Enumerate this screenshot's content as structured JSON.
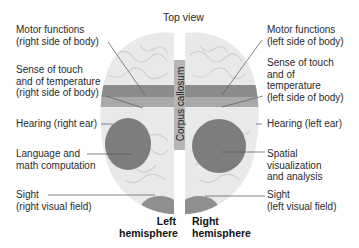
{
  "title": "Top view",
  "corpus_callosum": "Corpus callosum",
  "hemispheres": {
    "left": [
      "Left",
      "hemisphere"
    ],
    "right": [
      "Right",
      "hemisphere"
    ]
  },
  "left_labels": [
    {
      "lines": [
        "Motor functions",
        "(right side of body)"
      ]
    },
    {
      "lines": [
        "Sense of touch",
        "and of temperature",
        "(right side of body)"
      ]
    },
    {
      "lines": [
        "Hearing (right ear)"
      ]
    },
    {
      "lines": [
        "Language and",
        "math computation"
      ]
    },
    {
      "lines": [
        "Sight",
        "(right visual field)"
      ]
    }
  ],
  "right_labels": [
    {
      "lines": [
        "Motor functions",
        "(left side of body)"
      ]
    },
    {
      "lines": [
        "Sense of touch",
        "and of",
        "temperature",
        "(left side of body)"
      ]
    },
    {
      "lines": [
        "Hearing (left ear)"
      ]
    },
    {
      "lines": [
        "Spatial",
        "visualization",
        "and analysis"
      ]
    },
    {
      "lines": [
        "Sight",
        "(left visual field)"
      ]
    }
  ],
  "colors": {
    "brain_fill": "#e9e9e9",
    "motor_band": "#8c8c8c",
    "touch_band": "#a9a9a9",
    "region_dark": "#7d7d7d",
    "callosum": "#b5b5b5",
    "leader_line": "#555555"
  }
}
